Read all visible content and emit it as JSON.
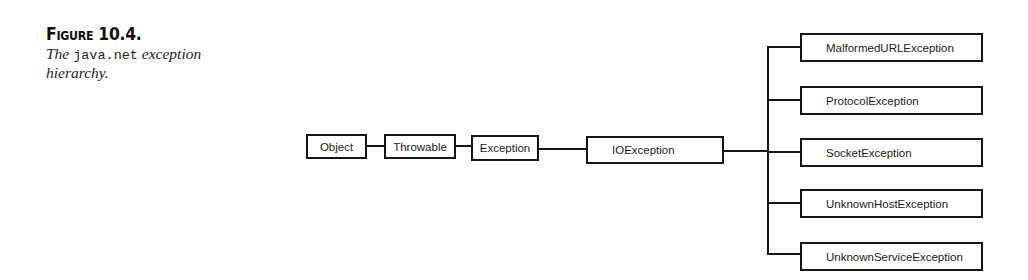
{
  "figure": {
    "title": "Figure 10.4.",
    "desc_prefix": "The",
    "desc_code": "java.net",
    "desc_suffix": "exception",
    "desc_line2": "hierarchy."
  },
  "diagram": {
    "chain": [
      {
        "id": "object",
        "label": "Object"
      },
      {
        "id": "throwable",
        "label": "Throwable"
      },
      {
        "id": "exception",
        "label": "Exception"
      },
      {
        "id": "ioexception",
        "label": "IOException"
      }
    ],
    "children": [
      {
        "id": "malformed",
        "label": "MalformedURLException"
      },
      {
        "id": "protocol",
        "label": "ProtocolException"
      },
      {
        "id": "socket",
        "label": "SocketException"
      },
      {
        "id": "unknownhost",
        "label": "UnknownHostException"
      },
      {
        "id": "unknownservice",
        "label": "UnknownServiceException"
      }
    ]
  }
}
